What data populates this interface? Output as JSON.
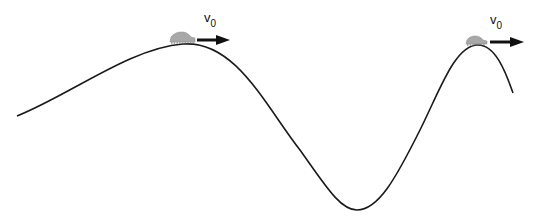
{
  "diagram": {
    "type": "physics-track",
    "colors": {
      "track": "#1a1a1a",
      "car": "#a8a8a8",
      "arrow": "#111111",
      "background": "#ffffff"
    },
    "cars": [
      {
        "position": "first-hilltop",
        "velocity_label": "v",
        "velocity_subscript": "0"
      },
      {
        "position": "second-hilltop",
        "velocity_label": "v",
        "velocity_subscript": "0"
      }
    ]
  }
}
